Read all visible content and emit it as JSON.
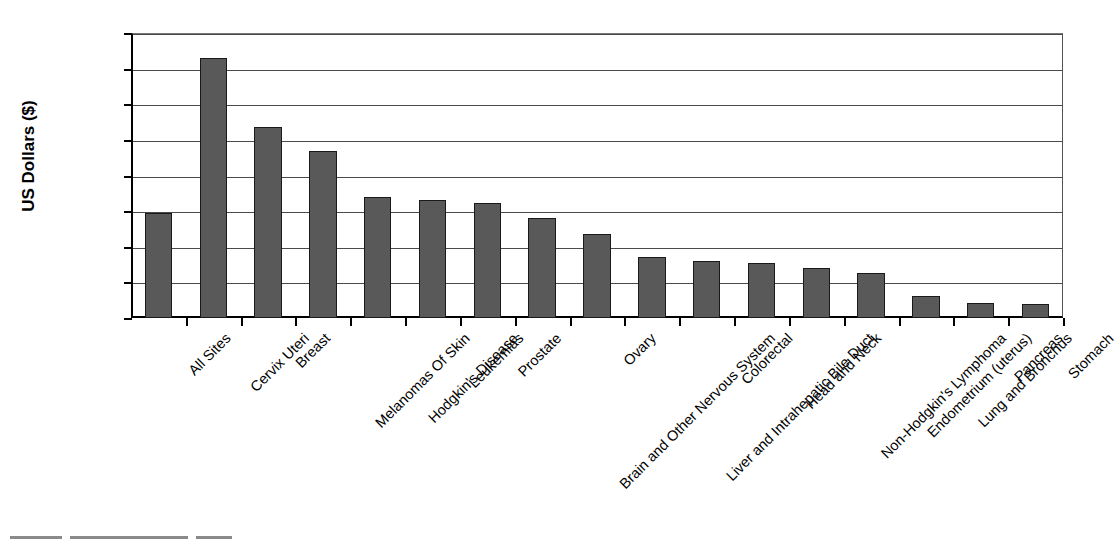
{
  "chart_data": {
    "type": "bar",
    "title": "",
    "xlabel": "",
    "ylabel": "US Dollars ($)",
    "ylim": [
      0,
      16000
    ],
    "ytick_step": 2000,
    "ytick_labels": [
      "$0",
      "$2,000",
      "$4,000",
      "$6,000",
      "$8,000",
      "$10,000",
      "$12,000",
      "$14,000",
      "$16,000"
    ],
    "ytick_values": [
      0,
      2000,
      4000,
      6000,
      8000,
      10000,
      12000,
      14000,
      16000
    ],
    "grid": true,
    "legend": "none",
    "bar_color": "#595959",
    "bar_edge_color": "#1a1a1a",
    "categories": [
      "All Sites",
      "Cervix Uteri",
      "Breast",
      "Melanomas Of Skin",
      "Hodgkin's Disease",
      "Leukemias",
      "Prostate",
      "Brain and Other Nervous System",
      "Ovary",
      "Liver and Intrahepatic Bile Duct",
      "Colorectal",
      "Head and Neck",
      "Non-Hodgkin's Lymphoma",
      "Endometrium (uterus)",
      "Lung and Bronchus",
      "Pancreas",
      "Stomach"
    ],
    "values": [
      5900,
      14600,
      10700,
      9350,
      6800,
      6600,
      6450,
      5600,
      4700,
      3400,
      3220,
      3100,
      2800,
      2540,
      1230,
      830,
      770
    ]
  }
}
